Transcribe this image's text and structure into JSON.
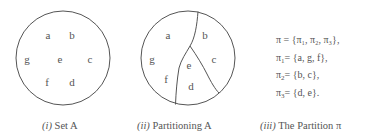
{
  "figure": {
    "panel_1": {
      "caption_num": "(i)",
      "caption_text": "Set A",
      "elements": [
        {
          "label": "a",
          "x": 48,
          "y": 39
        },
        {
          "label": "b",
          "x": 72,
          "y": 39
        },
        {
          "label": "g",
          "x": 27,
          "y": 63
        },
        {
          "label": "e",
          "x": 60,
          "y": 63
        },
        {
          "label": "c",
          "x": 90,
          "y": 63
        },
        {
          "label": "f",
          "x": 47,
          "y": 86
        },
        {
          "label": "d",
          "x": 72,
          "y": 86
        }
      ]
    },
    "panel_2": {
      "caption_num": "(ii)",
      "caption_text": "Partitioning A",
      "elements": [
        {
          "label": "a",
          "x": 168,
          "y": 39
        },
        {
          "label": "b",
          "x": 205,
          "y": 39
        },
        {
          "label": "g",
          "x": 152,
          "y": 63
        },
        {
          "label": "e",
          "x": 189,
          "y": 69
        },
        {
          "label": "c",
          "x": 214,
          "y": 63
        },
        {
          "label": "f",
          "x": 166,
          "y": 83
        },
        {
          "label": "d",
          "x": 191,
          "y": 90
        }
      ]
    },
    "panel_3": {
      "caption_num": "(iii)",
      "caption_text": "The Partition π",
      "equations": [
        {
          "lhs": "π",
          "lhs_sub": "",
          "rhs": "= {π₁, π₂, π₃},"
        },
        {
          "lhs": "π",
          "lhs_sub": "1",
          "rhs": "= {a, g, f},"
        },
        {
          "lhs": "π",
          "lhs_sub": "2",
          "rhs": "= {b, c},"
        },
        {
          "lhs": "π",
          "lhs_sub": "3",
          "rhs": "= {d, e}."
        }
      ]
    }
  },
  "colors": {
    "stroke": "#555555",
    "text": "#555555",
    "background": "#ffffff"
  }
}
